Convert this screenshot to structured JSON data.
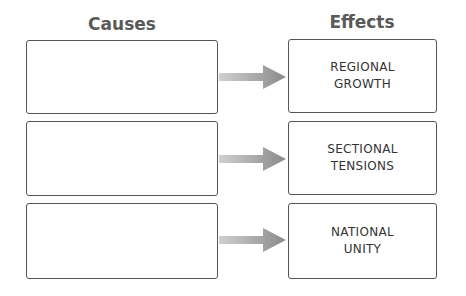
{
  "headers": {
    "causes": "Causes",
    "effects": "Effects"
  },
  "rows": [
    {
      "cause": "",
      "effect": "REGIONAL\nGROWTH"
    },
    {
      "cause": "",
      "effect": "SECTIONAL\nTENSIONS"
    },
    {
      "cause": "",
      "effect": "NATIONAL\nUNITY"
    }
  ],
  "colors": {
    "title": "#595959",
    "border": "#555555",
    "arrow": "#8c8c8c"
  }
}
